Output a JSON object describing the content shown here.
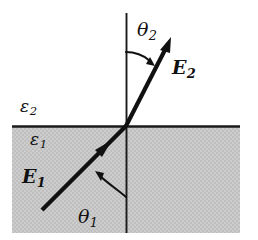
{
  "figure": {
    "type": "physics-diagram",
    "width": 258,
    "height": 240,
    "background_color": "#ffffff",
    "stroke_color": "#111111",
    "shaded_region": {
      "name": "lower-medium",
      "fill_color": "#c9c9c9",
      "pattern": "dither",
      "x": 12,
      "y": 126,
      "width": 228,
      "height": 107
    },
    "interface_line": {
      "name": "dielectric-interface",
      "x1": 12,
      "y1": 126,
      "x2": 240,
      "y2": 126
    },
    "normal_line": {
      "name": "surface-normal",
      "x1": 126,
      "y1": 13,
      "x2": 126,
      "y2": 233
    },
    "intersection_point": {
      "x": 126,
      "y": 126
    }
  },
  "labels": {
    "epsilon_upper": {
      "symbol": "ε",
      "subscript": "2"
    },
    "epsilon_lower": {
      "symbol": "ε",
      "subscript": "1"
    },
    "theta_upper": {
      "symbol": "θ",
      "subscript": "2"
    },
    "theta_lower": {
      "symbol": "θ",
      "subscript": "1"
    },
    "field_upper": {
      "symbol": "E",
      "subscript": "2"
    },
    "field_lower": {
      "symbol": "E",
      "subscript": "1"
    }
  },
  "rays": [
    {
      "name": "incident-ray-E1",
      "from": {
        "x": 42,
        "y": 210
      },
      "to": {
        "x": 126,
        "y": 126
      },
      "arrowhead": "mid",
      "arrow_at": {
        "x": 104,
        "y": 148
      },
      "stroke_width": 4
    },
    {
      "name": "refracted-ray-E2",
      "from": {
        "x": 126,
        "y": 126
      },
      "to": {
        "x": 170,
        "y": 40
      },
      "arrowhead": "tip",
      "stroke_width": 4
    }
  ],
  "angle_arcs": [
    {
      "name": "theta1-arc",
      "from_normal": true,
      "direction": "counterclockwise",
      "start": {
        "x": 126,
        "y": 196
      },
      "end": {
        "x": 98,
        "y": 174
      },
      "stroke_width": 2
    },
    {
      "name": "theta2-arc",
      "from_normal": true,
      "direction": "clockwise",
      "start": {
        "x": 126,
        "y": 52
      },
      "end": {
        "x": 150,
        "y": 62
      },
      "stroke_width": 2
    }
  ]
}
